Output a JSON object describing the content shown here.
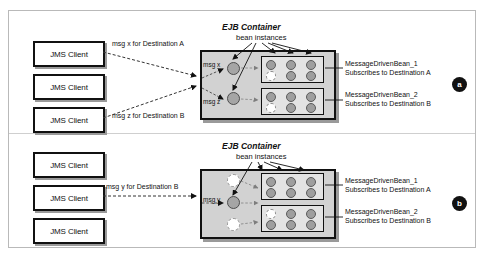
{
  "figure": {
    "colors": {
      "container_fill": "#d2d2d2",
      "pool_fill": "#e3e3e3",
      "bean_fill": "#9e9e9e",
      "badge_bg": "#111111",
      "frame_border": "#b9b9b9"
    }
  },
  "panel_a": {
    "badge": "a",
    "ejb_title": "EJB Container",
    "bean_caption": "bean instances",
    "clients": [
      {
        "label": "JMS Client"
      },
      {
        "label": "JMS Client"
      },
      {
        "label": "JMS Client"
      }
    ],
    "flows": [
      {
        "label": "msg x for Destination A"
      },
      {
        "label": "msg z for Destination B"
      }
    ],
    "messages": [
      {
        "label": "msg x"
      },
      {
        "label": "msg z"
      }
    ],
    "pools": [
      {
        "name_line1": "MessageDrivenBean_1",
        "name_line2": "Subscribes to Destination A"
      },
      {
        "name_line1": "MessageDrivenBean_2",
        "name_line2": "Subscribes to Destination B"
      }
    ]
  },
  "panel_b": {
    "badge": "b",
    "ejb_title": "EJB Container",
    "bean_caption": "bean instances",
    "clients": [
      {
        "label": "JMS Client"
      },
      {
        "label": "JMS Client"
      },
      {
        "label": "JMS Client"
      }
    ],
    "flows": [
      {
        "label": "msg y for Destination B"
      }
    ],
    "messages": [
      {
        "label": "msg y"
      }
    ],
    "pools": [
      {
        "name_line1": "MessageDrivenBean_1",
        "name_line2": "Subscribes to Destination A"
      },
      {
        "name_line1": "MessageDrivenBean_2",
        "name_line2": "Subscribes to Destination B"
      }
    ]
  }
}
